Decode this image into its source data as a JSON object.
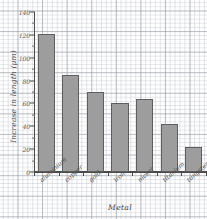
{
  "chart_data": {
    "type": "bar",
    "title": "",
    "xlabel": "Metal",
    "ylabel": "Increase in length (μm)",
    "categories": [
      "aluminium",
      "copper",
      "gold",
      "iron",
      "nickel",
      "titanium",
      "tungsten"
    ],
    "values": [
      121,
      85,
      70,
      60,
      64,
      42,
      22
    ],
    "ylim": [
      0,
      140
    ],
    "yticks": [
      0,
      20,
      40,
      60,
      80,
      100,
      120,
      140
    ],
    "ytick_labels": [
      "0",
      "20",
      "40",
      "60",
      "80",
      "100",
      "120",
      "140"
    ],
    "grid": true,
    "legend": false,
    "bar_color": "#9d9d9d",
    "bar_border_color": "#5e5e5e",
    "axis_color": "#4a4a4a",
    "grid_color": "#b9becb",
    "background": "#fefefe"
  },
  "axes": {
    "y_title": "Increase in length (μm)",
    "x_title": "Metal"
  },
  "top_caption": ""
}
